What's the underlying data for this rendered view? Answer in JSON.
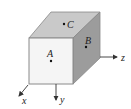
{
  "diagram": {
    "type": "3d-cube-with-axes",
    "points": [
      {
        "label": "A",
        "face": "front"
      },
      {
        "label": "B",
        "face": "right"
      },
      {
        "label": "C",
        "face": "top"
      }
    ],
    "axes": [
      {
        "label": "x"
      },
      {
        "label": "y"
      },
      {
        "label": "z"
      }
    ],
    "colors": {
      "front_face": "#f4f4f4",
      "top_face": "#c8c8c8",
      "right_face": "#9a9a9a",
      "edge": "#7a7a7a",
      "axis": "#333333"
    }
  }
}
